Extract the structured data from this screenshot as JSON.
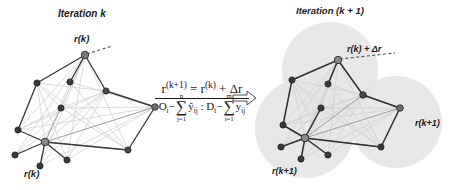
{
  "figure": {
    "title_left": "Iteration k",
    "title_right": "Iteration (k + 1)",
    "arrow_icon": "hollow-right-arrow-icon",
    "background_color": "#ffffff"
  },
  "left_panel": {
    "caption": "Iteration k",
    "labels": [
      {
        "id": "top-root",
        "text": "r(k)"
      },
      {
        "id": "bottom-root",
        "text": "r(k)"
      }
    ],
    "colors": {
      "node_fill": "#6b6b6b",
      "node_stroke": "#2a2a2a",
      "edge_strong": "#3a3a3a",
      "edge_weak": "#c9c9c9",
      "edge_mid": "#8f8f8f",
      "dash": "#555555"
    },
    "nodes": [
      {
        "id": "n1",
        "x": 85,
        "y": 55,
        "r": 3.6,
        "role": "root"
      },
      {
        "id": "n2",
        "x": 37,
        "y": 83,
        "r": 3.0,
        "role": "leaf"
      },
      {
        "id": "n3",
        "x": 70,
        "y": 82,
        "r": 3.0,
        "role": "leaf"
      },
      {
        "id": "n4",
        "x": 106,
        "y": 91,
        "r": 3.0,
        "role": "leaf"
      },
      {
        "id": "n5",
        "x": 61,
        "y": 108,
        "r": 3.0,
        "role": "leaf"
      },
      {
        "id": "n6",
        "x": 155,
        "y": 107,
        "r": 3.2,
        "role": "leaf"
      },
      {
        "id": "n7",
        "x": 18,
        "y": 130,
        "r": 3.0,
        "role": "leaf"
      },
      {
        "id": "n8",
        "x": 45,
        "y": 142,
        "r": 3.6,
        "role": "hub"
      },
      {
        "id": "n9",
        "x": 15,
        "y": 155,
        "r": 3.0,
        "role": "leaf"
      },
      {
        "id": "n10",
        "x": 40,
        "y": 166,
        "r": 3.0,
        "role": "leaf"
      },
      {
        "id": "n11",
        "x": 67,
        "y": 160,
        "r": 3.0,
        "role": "leaf"
      },
      {
        "id": "n12",
        "x": 128,
        "y": 150,
        "r": 3.0,
        "role": "leaf"
      }
    ]
  },
  "right_panel": {
    "caption": "Iteration (k + 1)",
    "labels": [
      {
        "id": "top-root",
        "text": "r(k) + Δr"
      },
      {
        "id": "right-circle",
        "text": "r(k+1)"
      },
      {
        "id": "bottom-circle",
        "text": "r(k+1)"
      }
    ],
    "colors": {
      "node_fill": "#6b6b6b",
      "node_stroke": "#2a2a2a",
      "edge_strong": "#2f2f2f",
      "edge_weak": "#cfcfcf",
      "edge_mid": "#9a9a9a",
      "halo": "#e2e2e2",
      "dash": "#555555"
    },
    "halos": [
      {
        "id": "halo-top",
        "cx": 330,
        "cy": 70,
        "r": 48
      },
      {
        "id": "halo-bottom",
        "cx": 305,
        "cy": 128,
        "r": 50
      },
      {
        "id": "halo-right",
        "cx": 396,
        "cy": 122,
        "r": 46
      }
    ],
    "nodes": [
      {
        "id": "m1",
        "x": 338,
        "y": 60,
        "r": 3.6,
        "role": "root"
      },
      {
        "id": "m2",
        "x": 292,
        "y": 80,
        "r": 3.0,
        "role": "leaf"
      },
      {
        "id": "m3",
        "x": 328,
        "y": 84,
        "r": 3.0,
        "role": "leaf"
      },
      {
        "id": "m4",
        "x": 363,
        "y": 95,
        "r": 3.2,
        "role": "leaf"
      },
      {
        "id": "m5",
        "x": 321,
        "y": 108,
        "r": 3.0,
        "role": "leaf"
      },
      {
        "id": "m6",
        "x": 400,
        "y": 108,
        "r": 3.2,
        "role": "leaf"
      },
      {
        "id": "m7",
        "x": 283,
        "y": 125,
        "r": 3.0,
        "role": "leaf"
      },
      {
        "id": "m8",
        "x": 305,
        "y": 138,
        "r": 3.6,
        "role": "hub"
      },
      {
        "id": "m9",
        "x": 281,
        "y": 147,
        "r": 3.0,
        "role": "leaf"
      },
      {
        "id": "m10",
        "x": 301,
        "y": 159,
        "r": 3.0,
        "role": "leaf"
      },
      {
        "id": "m11",
        "x": 328,
        "y": 155,
        "r": 3.0,
        "role": "leaf"
      },
      {
        "id": "m12",
        "x": 381,
        "y": 147,
        "r": 3.0,
        "role": "leaf"
      }
    ]
  },
  "formula": {
    "numerator": {
      "lhs": "r",
      "lhs_sup": "(k+1)",
      "eq": "=",
      "rhs": "r",
      "rhs_sup": "(k)",
      "plus": "+",
      "delta": "Δr",
      "full_text": "r^(k+1) = r^(k) + Δr"
    },
    "denominator": {
      "term1_var": "O",
      "term1_sub": "i",
      "minus": "−",
      "sum1_symbol": "∑",
      "sum1_upper": "n",
      "sum1_lower": "j=1",
      "sum1_term": "ŷ",
      "sum1_term_sub": "ij",
      "separator": ":",
      "term2_var": "D",
      "term2_sub": "t",
      "sum2_symbol": "∑",
      "sum2_upper": "m",
      "sum2_lower": "i=1",
      "sum2_term": "y",
      "sum2_term_sub": "ij",
      "full_text": "O_i − ∑(j=1..n) ŷ_ij : D_t − ∑(i=1..m) y_ij"
    }
  }
}
